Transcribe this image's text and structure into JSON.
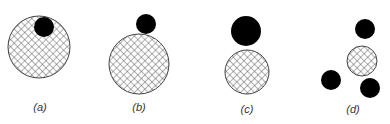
{
  "figure": {
    "panels": [
      {
        "label": "(a)",
        "letter": "a",
        "description": "small black particle inside large hatched circle"
      },
      {
        "label": "(b)",
        "letter": "b",
        "description": "small black particle touching top of large hatched circle"
      },
      {
        "label": "(c)",
        "letter": "c",
        "description": "larger black particle touching top of medium hatched circle"
      },
      {
        "label": "(d)",
        "letter": "d",
        "description": "three black particles surrounding small hatched circle"
      }
    ],
    "colors": {
      "solid": "#000000",
      "hatch": "#555555",
      "background": "#ffffff"
    }
  }
}
